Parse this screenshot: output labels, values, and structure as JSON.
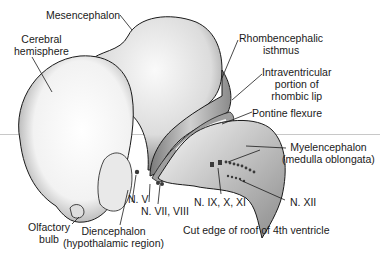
{
  "figure": {
    "labels": {
      "mesencephalon": "Mesencephalon",
      "cerebral_hemisphere": [
        "Cerebral",
        "hemisphere"
      ],
      "rhombencephalic_isthmus": [
        "Rhombencephalic",
        "isthmus"
      ],
      "intraventricular_rhombic_lip": [
        "Intraventricular",
        "portion of",
        "rhombic lip"
      ],
      "pontine_flexure": "Pontine flexure",
      "myelencephalon": [
        "Myelencephalon",
        "(medulla oblongata)"
      ],
      "n_v": "N. V",
      "n_vii_viii": "N. VII, VIII",
      "n_ix_x_xi": "N. IX, X, XI",
      "n_xii": "N. XII",
      "olfactory_bulb": [
        "Olfactory",
        "bulb"
      ],
      "diencephalon": [
        "Diencephalon",
        "(hypothalamic region)"
      ],
      "cut_edge": "Cut edge of roof of 4th ventricle"
    },
    "colors": {
      "ink": "#1a1a1a",
      "shade": "#bdbdbd",
      "guide_line": "#c8c8c8"
    }
  }
}
